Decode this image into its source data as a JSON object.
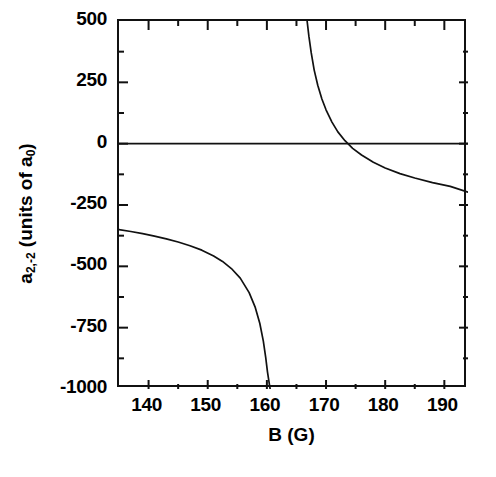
{
  "chart_data": {
    "type": "line",
    "title": "",
    "xlabel": "B (G)",
    "ylabel": "a_2,-2 (units of a_0)",
    "ylabel_parts": {
      "symbol": "a",
      "symbol_sub": "2,-2",
      "units_text": " (units of a",
      "units_sub": "0",
      "units_close": ")"
    },
    "xlim": [
      135,
      194
    ],
    "ylim": [
      -1000,
      500
    ],
    "xticks": [
      140,
      150,
      160,
      170,
      180,
      190
    ],
    "xticklabels": [
      "140",
      "150",
      "160",
      "170",
      "180",
      "190"
    ],
    "xminorticks": [
      135,
      145,
      155,
      165,
      175,
      185
    ],
    "yticks": [
      500,
      250,
      0,
      -250,
      -500,
      -750,
      -1000
    ],
    "yticklabels": [
      "500",
      "250",
      "0",
      "-250",
      "-500",
      "-750",
      "-1000"
    ],
    "yminorticks": [
      375,
      125,
      -125,
      -375,
      -625,
      -875
    ],
    "grid": false,
    "legend": null,
    "line_color": "#111111",
    "frame_color": "#111111",
    "background_color": "#ffffff",
    "annotations": {
      "zero_line_value": 0,
      "resonance_position_G": 162.3,
      "zero_crossing_G": 172.0,
      "background_scattering_length_a0": -200,
      "left_branch_left_endpoint": {
        "B": 135,
        "a": -350
      },
      "left_branch_divergence_G": 160.5,
      "right_branch_entry_top_G": 166.8,
      "right_branch_right_endpoint": {
        "B": 194,
        "a": -198
      }
    },
    "series": [
      {
        "name": "a_2,-2 lower branch",
        "x": [
          135,
          137,
          139,
          141,
          143,
          145,
          147,
          149,
          151,
          152.5,
          154,
          155.5,
          157,
          158,
          158.8,
          159.4,
          159.8,
          160.1,
          160.3,
          160.45,
          160.55
        ],
        "y": [
          -350,
          -358,
          -367,
          -377,
          -388,
          -401,
          -416,
          -434,
          -458,
          -480,
          -509,
          -548,
          -607,
          -665,
          -732,
          -805,
          -871,
          -930,
          -962,
          -985,
          -1000
        ]
      },
      {
        "name": "a_2,-2 upper branch",
        "x": [
          166.8,
          167.1,
          167.5,
          168,
          168.6,
          169.3,
          170,
          171,
          172,
          173.2,
          174.5,
          176,
          178,
          180,
          182.5,
          185,
          188,
          191,
          194
        ],
        "y": [
          500,
          438,
          370,
          300,
          238,
          182,
          138,
          88,
          48,
          12,
          -19,
          -46,
          -76,
          -99,
          -122,
          -140,
          -159,
          -174,
          -198
        ]
      },
      {
        "name": "zero reference line",
        "x": [
          135,
          194
        ],
        "y": [
          0,
          0
        ]
      }
    ]
  },
  "axis": {
    "y_tick_labels": [
      "500",
      "250",
      "0",
      "-250",
      "-500",
      "-750",
      "-1000"
    ],
    "x_tick_labels": [
      "140",
      "150",
      "160",
      "170",
      "180",
      "190"
    ],
    "x_title": "B (G)"
  }
}
